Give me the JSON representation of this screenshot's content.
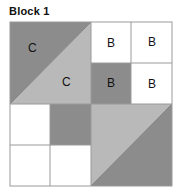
{
  "title": "Block 1",
  "colors": {
    "dark": "#8c8c8c",
    "light": "#b9b9b9",
    "white": "#ffffff",
    "border": "#9a9a9a"
  },
  "labels": {
    "c_top": "C",
    "c_mid": "C",
    "b_r1c3": "B",
    "b_r1c4": "B",
    "b_r2c3": "B",
    "b_r2c4": "B"
  }
}
